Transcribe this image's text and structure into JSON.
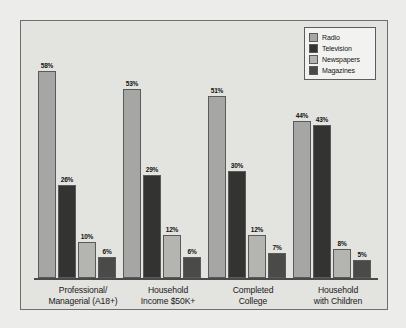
{
  "chart_data": {
    "type": "bar",
    "title": "",
    "xlabel": "",
    "ylabel": "",
    "ylim": [
      0,
      60
    ],
    "grid": false,
    "legend_position": "top-right",
    "categories": [
      "Professional/ Managerial (A18+)",
      "Household Income $50K+",
      "Completed College",
      "Household with Children"
    ],
    "category_lines": [
      [
        "Professional/",
        "Managerial (A18+)"
      ],
      [
        "Household",
        "Income $50K+"
      ],
      [
        "Completed",
        "College"
      ],
      [
        "Household",
        "with Children"
      ]
    ],
    "series": [
      {
        "name": "Radio",
        "color": "#a6a6a4",
        "values": [
          58,
          53,
          51,
          44
        ],
        "labels": [
          "58%",
          "53%",
          "51%",
          "44%"
        ]
      },
      {
        "name": "Television",
        "color": "#333331",
        "values": [
          26,
          29,
          30,
          43
        ],
        "labels": [
          "26%",
          "29%",
          "30%",
          "43%"
        ]
      },
      {
        "name": "Newspapers",
        "color": "#b4b4b1",
        "values": [
          10,
          12,
          12,
          8
        ],
        "labels": [
          "10%",
          "12%",
          "12%",
          "8%"
        ]
      },
      {
        "name": "Magazines",
        "color": "#4a4a48",
        "values": [
          6,
          6,
          7,
          5
        ],
        "labels": [
          "6%",
          "6%",
          "7%",
          "5%"
        ]
      }
    ]
  },
  "legend": {
    "items": [
      {
        "label": "Radio"
      },
      {
        "label": "Television"
      },
      {
        "label": "Newspapers"
      },
      {
        "label": "Magazines"
      }
    ]
  },
  "colors": {
    "frame_border": "#6e6e6e",
    "plot_background": "#e3e3e0",
    "page_background": "#ececeb",
    "axis": "#4a4a4a"
  }
}
